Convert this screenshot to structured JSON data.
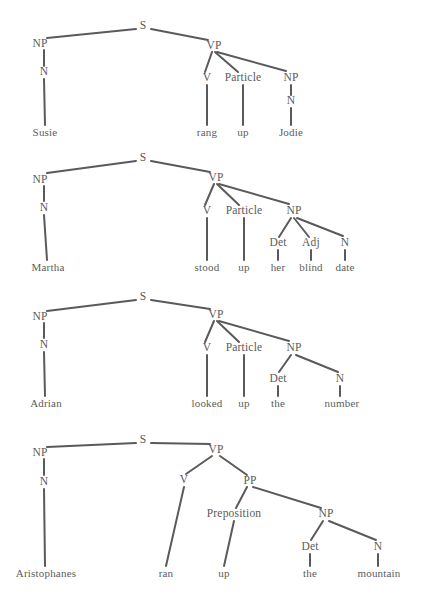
{
  "figure": {
    "background_color": "#ffffff",
    "line_color": "#5a5a5a",
    "text_color": "#5a5a5a",
    "width": 422,
    "height": 599
  },
  "trees": [
    {
      "id": "tree-1",
      "sentence": "Susie rang up Jodie",
      "nodes": [
        {
          "id": "s",
          "label": "S",
          "x": 143,
          "y": 26,
          "kind": "cat"
        },
        {
          "id": "np1",
          "label": "NP",
          "x": 40,
          "y": 44,
          "kind": "cat"
        },
        {
          "id": "n1",
          "label": "N",
          "x": 44,
          "y": 72,
          "kind": "cat"
        },
        {
          "id": "w1",
          "label": "Susie",
          "x": 45,
          "y": 132,
          "kind": "word"
        },
        {
          "id": "vp",
          "label": "VP",
          "x": 214,
          "y": 46,
          "kind": "cat"
        },
        {
          "id": "v",
          "label": "V",
          "x": 207,
          "y": 78,
          "kind": "cat"
        },
        {
          "id": "w2",
          "label": "rang",
          "x": 207,
          "y": 132,
          "kind": "word"
        },
        {
          "id": "part",
          "label": "Particle",
          "x": 243,
          "y": 78,
          "kind": "cat"
        },
        {
          "id": "w3",
          "label": "up",
          "x": 243,
          "y": 132,
          "kind": "word"
        },
        {
          "id": "np2",
          "label": "NP",
          "x": 291,
          "y": 78,
          "kind": "cat"
        },
        {
          "id": "n2",
          "label": "N",
          "x": 291,
          "y": 101,
          "kind": "cat"
        },
        {
          "id": "w4",
          "label": "Jodie",
          "x": 291,
          "y": 132,
          "kind": "word"
        }
      ],
      "edges": [
        {
          "x1": 136,
          "y1": 29,
          "x2": 47,
          "y2": 38
        },
        {
          "x1": 151,
          "y1": 29,
          "x2": 208,
          "y2": 40
        },
        {
          "x1": 44,
          "y1": 50,
          "x2": 44,
          "y2": 66
        },
        {
          "x1": 44,
          "y1": 79,
          "x2": 45,
          "y2": 125
        },
        {
          "x1": 212,
          "y1": 52,
          "x2": 205,
          "y2": 72
        },
        {
          "x1": 215,
          "y1": 52,
          "x2": 238,
          "y2": 72
        },
        {
          "x1": 217,
          "y1": 52,
          "x2": 286,
          "y2": 71
        },
        {
          "x1": 207,
          "y1": 85,
          "x2": 207,
          "y2": 125
        },
        {
          "x1": 243,
          "y1": 85,
          "x2": 243,
          "y2": 125
        },
        {
          "x1": 291,
          "y1": 85,
          "x2": 291,
          "y2": 95
        },
        {
          "x1": 291,
          "y1": 108,
          "x2": 291,
          "y2": 125
        }
      ]
    },
    {
      "id": "tree-2",
      "sentence": "Martha stood up her blind date",
      "nodes": [
        {
          "id": "s",
          "label": "S",
          "x": 143,
          "y": 158,
          "kind": "cat"
        },
        {
          "id": "np1",
          "label": "NP",
          "x": 40,
          "y": 180,
          "kind": "cat"
        },
        {
          "id": "n1",
          "label": "N",
          "x": 44,
          "y": 208,
          "kind": "cat"
        },
        {
          "id": "w1",
          "label": "Martha",
          "x": 48,
          "y": 267,
          "kind": "word"
        },
        {
          "id": "vp",
          "label": "VP",
          "x": 216,
          "y": 178,
          "kind": "cat"
        },
        {
          "id": "v",
          "label": "V",
          "x": 207,
          "y": 211,
          "kind": "cat"
        },
        {
          "id": "w2",
          "label": "stood",
          "x": 207,
          "y": 267,
          "kind": "word"
        },
        {
          "id": "part",
          "label": "Particle",
          "x": 244,
          "y": 211,
          "kind": "cat"
        },
        {
          "id": "w3",
          "label": "up",
          "x": 244,
          "y": 267,
          "kind": "word"
        },
        {
          "id": "np2",
          "label": "NP",
          "x": 294,
          "y": 211,
          "kind": "cat"
        },
        {
          "id": "det",
          "label": "Det",
          "x": 278,
          "y": 243,
          "kind": "cat"
        },
        {
          "id": "w4",
          "label": "her",
          "x": 278,
          "y": 267,
          "kind": "word"
        },
        {
          "id": "adj",
          "label": "Adj",
          "x": 311,
          "y": 243,
          "kind": "cat"
        },
        {
          "id": "w5",
          "label": "blind",
          "x": 311,
          "y": 267,
          "kind": "word"
        },
        {
          "id": "n2",
          "label": "N",
          "x": 345,
          "y": 243,
          "kind": "cat"
        },
        {
          "id": "w6",
          "label": "date",
          "x": 345,
          "y": 267,
          "kind": "word"
        }
      ],
      "edges": [
        {
          "x1": 136,
          "y1": 161,
          "x2": 47,
          "y2": 173
        },
        {
          "x1": 151,
          "y1": 161,
          "x2": 210,
          "y2": 172
        },
        {
          "x1": 44,
          "y1": 186,
          "x2": 44,
          "y2": 201
        },
        {
          "x1": 44,
          "y1": 215,
          "x2": 47,
          "y2": 260
        },
        {
          "x1": 214,
          "y1": 184,
          "x2": 205,
          "y2": 205
        },
        {
          "x1": 217,
          "y1": 184,
          "x2": 239,
          "y2": 205
        },
        {
          "x1": 219,
          "y1": 184,
          "x2": 289,
          "y2": 204
        },
        {
          "x1": 207,
          "y1": 218,
          "x2": 207,
          "y2": 260
        },
        {
          "x1": 244,
          "y1": 218,
          "x2": 244,
          "y2": 260
        },
        {
          "x1": 291,
          "y1": 218,
          "x2": 279,
          "y2": 237
        },
        {
          "x1": 294,
          "y1": 218,
          "x2": 309,
          "y2": 237
        },
        {
          "x1": 297,
          "y1": 218,
          "x2": 343,
          "y2": 236
        },
        {
          "x1": 278,
          "y1": 250,
          "x2": 278,
          "y2": 260
        },
        {
          "x1": 311,
          "y1": 250,
          "x2": 311,
          "y2": 260
        },
        {
          "x1": 345,
          "y1": 250,
          "x2": 345,
          "y2": 260
        }
      ]
    },
    {
      "id": "tree-3",
      "sentence": "Adrian looked up the number",
      "nodes": [
        {
          "id": "s",
          "label": "S",
          "x": 143,
          "y": 297,
          "kind": "cat"
        },
        {
          "id": "np1",
          "label": "NP",
          "x": 40,
          "y": 317,
          "kind": "cat"
        },
        {
          "id": "n1",
          "label": "N",
          "x": 44,
          "y": 345,
          "kind": "cat"
        },
        {
          "id": "w1",
          "label": "Adrian",
          "x": 46,
          "y": 403,
          "kind": "word"
        },
        {
          "id": "vp",
          "label": "VP",
          "x": 216,
          "y": 315,
          "kind": "cat"
        },
        {
          "id": "v",
          "label": "V",
          "x": 207,
          "y": 348,
          "kind": "cat"
        },
        {
          "id": "w2",
          "label": "looked",
          "x": 207,
          "y": 403,
          "kind": "word"
        },
        {
          "id": "part",
          "label": "Particle",
          "x": 244,
          "y": 348,
          "kind": "cat"
        },
        {
          "id": "w3",
          "label": "up",
          "x": 244,
          "y": 403,
          "kind": "word"
        },
        {
          "id": "np2",
          "label": "NP",
          "x": 294,
          "y": 348,
          "kind": "cat"
        },
        {
          "id": "det",
          "label": "Det",
          "x": 278,
          "y": 379,
          "kind": "cat"
        },
        {
          "id": "w4",
          "label": "the",
          "x": 278,
          "y": 403,
          "kind": "word"
        },
        {
          "id": "n2",
          "label": "N",
          "x": 340,
          "y": 379,
          "kind": "cat"
        },
        {
          "id": "w5",
          "label": "number",
          "x": 342,
          "y": 403,
          "kind": "word"
        }
      ],
      "edges": [
        {
          "x1": 136,
          "y1": 300,
          "x2": 47,
          "y2": 311
        },
        {
          "x1": 151,
          "y1": 300,
          "x2": 210,
          "y2": 309
        },
        {
          "x1": 44,
          "y1": 323,
          "x2": 44,
          "y2": 338
        },
        {
          "x1": 44,
          "y1": 352,
          "x2": 45,
          "y2": 396
        },
        {
          "x1": 214,
          "y1": 321,
          "x2": 205,
          "y2": 342
        },
        {
          "x1": 217,
          "y1": 321,
          "x2": 239,
          "y2": 342
        },
        {
          "x1": 219,
          "y1": 321,
          "x2": 289,
          "y2": 341
        },
        {
          "x1": 207,
          "y1": 355,
          "x2": 207,
          "y2": 396
        },
        {
          "x1": 244,
          "y1": 355,
          "x2": 244,
          "y2": 396
        },
        {
          "x1": 291,
          "y1": 355,
          "x2": 279,
          "y2": 372
        },
        {
          "x1": 296,
          "y1": 355,
          "x2": 338,
          "y2": 372
        },
        {
          "x1": 278,
          "y1": 386,
          "x2": 278,
          "y2": 396
        },
        {
          "x1": 340,
          "y1": 386,
          "x2": 340,
          "y2": 396
        }
      ]
    },
    {
      "id": "tree-4",
      "sentence": "Aristophanes ran up the mountain",
      "nodes": [
        {
          "id": "s",
          "label": "S",
          "x": 143,
          "y": 440,
          "kind": "cat"
        },
        {
          "id": "np1",
          "label": "NP",
          "x": 40,
          "y": 453,
          "kind": "cat"
        },
        {
          "id": "n1",
          "label": "N",
          "x": 44,
          "y": 482,
          "kind": "cat"
        },
        {
          "id": "w1",
          "label": "Aristophanes",
          "x": 46,
          "y": 573,
          "kind": "word"
        },
        {
          "id": "vp",
          "label": "VP",
          "x": 216,
          "y": 450,
          "kind": "cat"
        },
        {
          "id": "v",
          "label": "V",
          "x": 184,
          "y": 480,
          "kind": "cat"
        },
        {
          "id": "w2",
          "label": "ran",
          "x": 166,
          "y": 573,
          "kind": "word"
        },
        {
          "id": "pp",
          "label": "PP",
          "x": 250,
          "y": 481,
          "kind": "cat"
        },
        {
          "id": "prep",
          "label": "Preposition",
          "x": 234,
          "y": 514,
          "kind": "cat"
        },
        {
          "id": "w3",
          "label": "up",
          "x": 224,
          "y": 573,
          "kind": "word"
        },
        {
          "id": "np2",
          "label": "NP",
          "x": 326,
          "y": 514,
          "kind": "cat"
        },
        {
          "id": "det",
          "label": "Det",
          "x": 310,
          "y": 547,
          "kind": "cat"
        },
        {
          "id": "w4",
          "label": "the",
          "x": 310,
          "y": 573,
          "kind": "word"
        },
        {
          "id": "n2",
          "label": "N",
          "x": 378,
          "y": 547,
          "kind": "cat"
        },
        {
          "id": "w5",
          "label": "mountain",
          "x": 379,
          "y": 573,
          "kind": "word"
        }
      ],
      "edges": [
        {
          "x1": 136,
          "y1": 443,
          "x2": 47,
          "y2": 447
        },
        {
          "x1": 151,
          "y1": 443,
          "x2": 210,
          "y2": 444
        },
        {
          "x1": 44,
          "y1": 459,
          "x2": 44,
          "y2": 475
        },
        {
          "x1": 44,
          "y1": 489,
          "x2": 45,
          "y2": 566
        },
        {
          "x1": 212,
          "y1": 456,
          "x2": 186,
          "y2": 474
        },
        {
          "x1": 220,
          "y1": 456,
          "x2": 247,
          "y2": 475
        },
        {
          "x1": 184,
          "y1": 487,
          "x2": 166,
          "y2": 566
        },
        {
          "x1": 247,
          "y1": 487,
          "x2": 236,
          "y2": 508
        },
        {
          "x1": 253,
          "y1": 487,
          "x2": 321,
          "y2": 508
        },
        {
          "x1": 234,
          "y1": 521,
          "x2": 224,
          "y2": 566
        },
        {
          "x1": 323,
          "y1": 521,
          "x2": 311,
          "y2": 540
        },
        {
          "x1": 329,
          "y1": 521,
          "x2": 376,
          "y2": 540
        },
        {
          "x1": 310,
          "y1": 554,
          "x2": 310,
          "y2": 566
        },
        {
          "x1": 378,
          "y1": 554,
          "x2": 378,
          "y2": 566
        }
      ]
    }
  ]
}
